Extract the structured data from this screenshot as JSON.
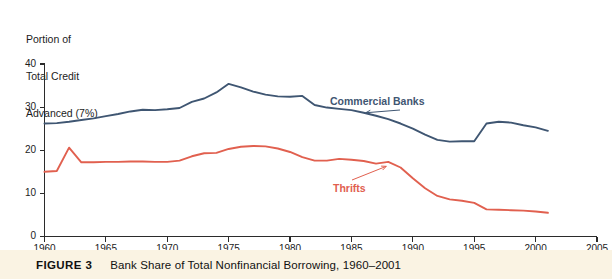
{
  "figure": {
    "caption_number": "FIGURE 3",
    "caption_title": "Bank Share of Total Nonfinancial Borrowing, 1960–2001"
  },
  "colors": {
    "commercial_banks": "#3f5672",
    "thrifts": "#e1604f",
    "axis": "#2b2b2b",
    "caption_band": "#faf3e3",
    "background": "#ffffff"
  },
  "chart_data": {
    "type": "line",
    "title": "Bank Share of Total Nonfinancial Borrowing, 1960–2001",
    "ylabel": "Portion of Total Credit Advanced (7%)",
    "ylabel_lines": [
      "Portion of",
      "Total Credit",
      "Advanced (7%)"
    ],
    "xlabel": "",
    "xlim": [
      1960,
      2005
    ],
    "ylim": [
      0,
      40
    ],
    "xticks": [
      1960,
      1965,
      1970,
      1975,
      1980,
      1985,
      1990,
      1995,
      2000,
      2005
    ],
    "xtick_labels": [
      "1960",
      "1965",
      "1970",
      "1975",
      "1980",
      "1985",
      "1990",
      "1995",
      "2000",
      "2005"
    ],
    "yticks": [
      0,
      10,
      20,
      30,
      40
    ],
    "ytick_labels": [
      "0",
      "10",
      "20",
      "30",
      "40"
    ],
    "grid": false,
    "legend_position": "inline-annotations",
    "annotations": [
      {
        "text": "Commercial Banks",
        "color": "#3f5672",
        "points_to_year": 1986,
        "points_to_value": 28.0
      },
      {
        "text": "Thrifts",
        "color": "#e1604f",
        "points_to_year": 1988,
        "points_to_value": 17.2
      }
    ],
    "x": [
      1960,
      1961,
      1962,
      1963,
      1964,
      1965,
      1966,
      1967,
      1968,
      1969,
      1970,
      1971,
      1972,
      1973,
      1974,
      1975,
      1976,
      1977,
      1978,
      1979,
      1980,
      1981,
      1982,
      1983,
      1984,
      1985,
      1986,
      1987,
      1988,
      1989,
      1990,
      1991,
      1992,
      1993,
      1994,
      1995,
      1996,
      1997,
      1998,
      1999,
      2000,
      2001
    ],
    "series": [
      {
        "name": "Commercial Banks",
        "color": "#3f5672",
        "values": [
          26.2,
          26.3,
          26.6,
          27.0,
          27.4,
          27.9,
          28.4,
          29.0,
          29.4,
          29.3,
          29.5,
          29.8,
          31.2,
          32.0,
          33.4,
          35.4,
          34.6,
          33.6,
          32.9,
          32.5,
          32.4,
          32.6,
          30.5,
          29.9,
          29.6,
          29.3,
          28.7,
          28.0,
          27.2,
          26.2,
          25.0,
          23.6,
          22.4,
          22.0,
          22.1,
          22.1,
          26.2,
          26.6,
          26.4,
          25.8,
          25.3,
          24.5
        ]
      },
      {
        "name": "Thrifts",
        "color": "#e1604f",
        "values": [
          15.0,
          15.2,
          20.6,
          17.2,
          17.2,
          17.3,
          17.3,
          17.4,
          17.4,
          17.3,
          17.3,
          17.6,
          18.6,
          19.3,
          19.4,
          20.3,
          20.8,
          21.0,
          20.9,
          20.4,
          19.6,
          18.4,
          17.6,
          17.6,
          18.0,
          17.8,
          17.5,
          16.9,
          17.3,
          16.0,
          13.5,
          11.2,
          9.4,
          8.6,
          8.3,
          7.8,
          6.3,
          6.2,
          6.1,
          6.0,
          5.8,
          5.5
        ]
      }
    ]
  }
}
